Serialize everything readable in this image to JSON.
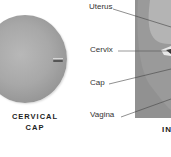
{
  "left_figure": {
    "title_line1": "CERVICAL",
    "title_line2": "CAP",
    "sphere_color": "#a8a8a8"
  },
  "right_figure": {
    "labels": [
      {
        "text": "Uterus"
      },
      {
        "text": "Cervix"
      },
      {
        "text": "Cap"
      },
      {
        "text": "Vagina"
      }
    ],
    "caption_partial": "IN",
    "panel_color": "#9a9a9a"
  }
}
